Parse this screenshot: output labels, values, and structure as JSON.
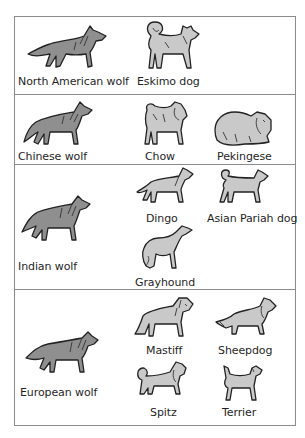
{
  "diagram": {
    "title": "",
    "rows": [
      {
        "wolf": {
          "label": "North American wolf",
          "icon": "wolf-icon"
        },
        "dogs": [
          {
            "label": "Eskimo dog",
            "icon": "eskimo-dog-icon"
          }
        ]
      },
      {
        "wolf": {
          "label": "Chinese wolf",
          "icon": "wolf-icon"
        },
        "dogs": [
          {
            "label": "Chow",
            "icon": "chow-icon"
          },
          {
            "label": "Pekingese",
            "icon": "pekingese-icon"
          }
        ]
      },
      {
        "wolf": {
          "label": "Indian wolf",
          "icon": "wolf-icon"
        },
        "dogs": [
          {
            "label": "Dingo",
            "icon": "dingo-icon"
          },
          {
            "label": "Asian Pariah dog",
            "icon": "pariah-dog-icon"
          },
          {
            "label": "Grayhound",
            "icon": "greyhound-icon"
          }
        ]
      },
      {
        "wolf": {
          "label": "European wolf",
          "icon": "wolf-icon"
        },
        "dogs": [
          {
            "label": "Mastiff",
            "icon": "mastiff-icon"
          },
          {
            "label": "Sheepdog",
            "icon": "sheepdog-icon"
          },
          {
            "label": "Spitz",
            "icon": "spitz-icon"
          },
          {
            "label": "Terrier",
            "icon": "terrier-icon"
          }
        ]
      }
    ],
    "colors": {
      "border": "#8c8c8c",
      "wolf_fill": "#8f8f8f",
      "dog_fill": "#c9c9c9",
      "outline": "#222222"
    }
  }
}
